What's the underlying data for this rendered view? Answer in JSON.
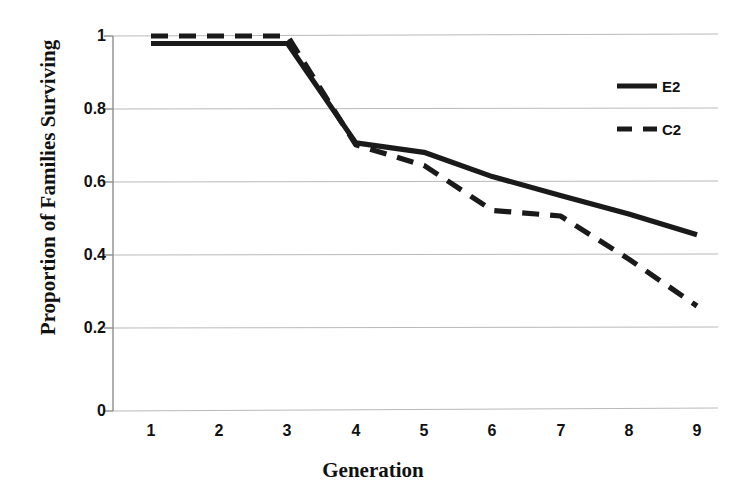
{
  "chart_data": {
    "type": "line",
    "title": "",
    "xlabel": "Generation",
    "ylabel": "Proportion of Families Surviving",
    "x": [
      1,
      2,
      3,
      4,
      5,
      6,
      7,
      8,
      9
    ],
    "xtick_labels": [
      "1",
      "2",
      "3",
      "4",
      "5",
      "6",
      "7",
      "8",
      "9"
    ],
    "ytick_labels": [
      "0",
      "0.2",
      "0.4",
      "0.6",
      "0.8",
      "1"
    ],
    "ytick_values": [
      0,
      0.2,
      0.4,
      0.6,
      0.8,
      1
    ],
    "xlim": [
      1,
      9
    ],
    "ylim": [
      0,
      1
    ],
    "grid": "horizontal",
    "legend_position": "upper right",
    "series": [
      {
        "name": "E2",
        "style": "solid",
        "color": "#1a1a1a",
        "values": [
          0.98,
          0.98,
          0.98,
          0.715,
          0.69,
          0.625,
          0.575,
          0.525,
          0.47
        ]
      },
      {
        "name": "C2",
        "style": "dashed",
        "color": "#1a1a1a",
        "values": [
          1.0,
          1.0,
          1.0,
          0.71,
          0.655,
          0.535,
          0.52,
          0.405,
          0.28
        ]
      }
    ]
  },
  "legend": {
    "entries": [
      {
        "label": "E2",
        "style": "solid"
      },
      {
        "label": "C2",
        "style": "dashed"
      }
    ]
  },
  "colors": {
    "line": "#1a1a1a",
    "grid": "#b8b8b8",
    "axis": "#8a8a8a",
    "background": "#ffffff",
    "text": "#111111"
  }
}
